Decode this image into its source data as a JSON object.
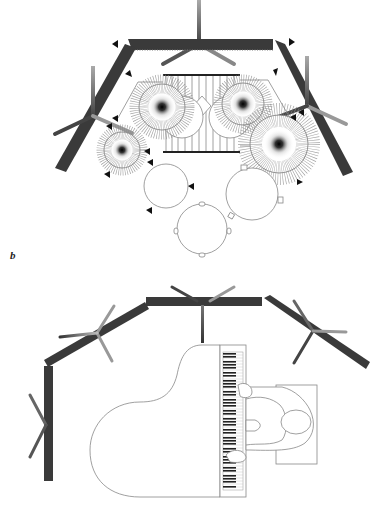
{
  "figure": {
    "panels": [
      {
        "id": "b",
        "label": "b",
        "subject": "drum-kit-top-view",
        "description": "Drum kit viewed from above surrounded by three-segment acoustic baffle with microphone stands"
      },
      {
        "id": "c",
        "label": "c",
        "subject": "grand-piano-top-view",
        "description": "Grand piano with pianist viewed from above surrounded by four-segment acoustic baffle with microphone stands"
      }
    ],
    "colors": {
      "baffle": "#3a3a3a",
      "baffle_teeth": "#555555",
      "outline": "#888888",
      "mic_stand_dark": "#444444",
      "mic_stand_light": "#bbbbbb",
      "marker": "#111111",
      "background": "#ffffff"
    }
  }
}
